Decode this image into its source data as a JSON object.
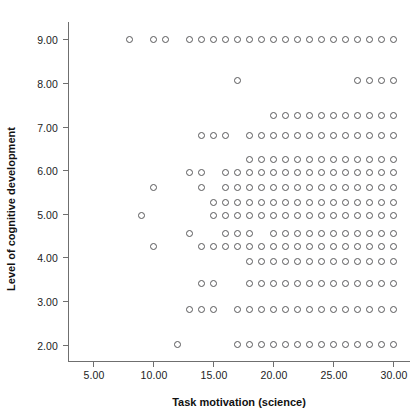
{
  "chart_data": {
    "type": "scatter",
    "title": "",
    "xlabel": "Task motivation (science)",
    "ylabel": "Level of cognitive development",
    "xlim": [
      3.0,
      31.5
    ],
    "ylim": [
      1.6,
      9.4
    ],
    "xticks": [
      5,
      10,
      15,
      20,
      25,
      30
    ],
    "xticklabels": [
      "5.00",
      "10.00",
      "15.00",
      "20.00",
      "25.00",
      "30.00"
    ],
    "yticks": [
      2,
      3,
      4,
      5,
      6,
      7,
      8,
      9
    ],
    "yticklabels": [
      "2.00",
      "3.00",
      "4.00",
      "5.00",
      "6.00",
      "7.00",
      "8.00",
      "9.00"
    ],
    "grid": false,
    "legend": null,
    "marker": "open-circle",
    "marker_color": "#58585a",
    "marker_fill": "none",
    "rows": [
      {
        "y": 9.0,
        "x": [
          8,
          10,
          11,
          13,
          14,
          15,
          16,
          17,
          18,
          19,
          20,
          21,
          22,
          23,
          24,
          25,
          26,
          27,
          28,
          29,
          30
        ]
      },
      {
        "y": 8.05,
        "x": [
          17,
          27,
          28,
          29,
          30
        ]
      },
      {
        "y": 7.25,
        "x": [
          20,
          21,
          22,
          23,
          24,
          25,
          26,
          27,
          28,
          29,
          30
        ]
      },
      {
        "y": 6.8,
        "x": [
          14,
          15,
          16,
          18,
          19,
          20,
          21,
          22,
          23,
          24,
          25,
          26,
          27,
          28,
          29,
          30
        ]
      },
      {
        "y": 6.25,
        "x": [
          18,
          19,
          20,
          21,
          22,
          23,
          24,
          25,
          26,
          27,
          28,
          29,
          30
        ]
      },
      {
        "y": 5.95,
        "x": [
          13,
          14,
          16,
          17,
          18,
          19,
          20,
          21,
          22,
          23,
          24,
          25,
          26,
          27,
          28,
          29,
          30
        ]
      },
      {
        "y": 5.6,
        "x": [
          10,
          14,
          16,
          17,
          18,
          19,
          20,
          21,
          22,
          23,
          24,
          25,
          26,
          27,
          28,
          29,
          30
        ]
      },
      {
        "y": 5.25,
        "x": [
          15,
          16,
          17,
          18,
          19,
          20,
          21,
          22,
          23,
          24,
          25,
          26,
          27,
          28,
          29,
          30
        ]
      },
      {
        "y": 4.95,
        "x": [
          9,
          15,
          16,
          17,
          18,
          19,
          20,
          21,
          22,
          23,
          24,
          25,
          26,
          27,
          28,
          29,
          30
        ]
      },
      {
        "y": 4.55,
        "x": [
          13,
          16,
          17,
          18,
          20,
          21,
          22,
          23,
          24,
          25,
          26,
          27,
          28,
          29,
          30
        ]
      },
      {
        "y": 4.25,
        "x": [
          10,
          14,
          15,
          16,
          17,
          18,
          19,
          20,
          21,
          22,
          23,
          24,
          25,
          26,
          27,
          28,
          29,
          30
        ]
      },
      {
        "y": 3.9,
        "x": [
          18,
          19,
          20,
          21,
          22,
          23,
          24,
          25,
          26,
          27,
          28,
          29,
          30
        ]
      },
      {
        "y": 3.4,
        "x": [
          14,
          15,
          18,
          19,
          20,
          21,
          22,
          23,
          24,
          25,
          26,
          27,
          28,
          29,
          30
        ]
      },
      {
        "y": 2.8,
        "x": [
          13,
          14,
          15,
          17,
          18,
          19,
          20,
          21,
          22,
          23,
          24,
          25,
          26,
          27,
          28,
          29,
          30
        ]
      },
      {
        "y": 2.0,
        "x": [
          12,
          17,
          18,
          19,
          20,
          21,
          22,
          23,
          24,
          25,
          26,
          27,
          28,
          29,
          30
        ]
      }
    ]
  }
}
